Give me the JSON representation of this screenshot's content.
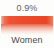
{
  "chart_data": {
    "type": "bar",
    "orientation": "horizontal",
    "title": "",
    "subtitle": "",
    "xlabel": "",
    "ylabel": "",
    "categories": [
      "Women"
    ],
    "values": [
      0.9
    ],
    "value_labels": [
      "0.9%"
    ],
    "unit": "%",
    "series": [
      {
        "name": "Women",
        "values": [
          0.9
        ],
        "color": "#ea4a2b"
      }
    ],
    "xlim": [
      0,
      0.9
    ],
    "grid": false,
    "legend": "none",
    "annotations": []
  },
  "widget": {
    "value_text": "0.9%",
    "category_text": "Women",
    "bar_fill_percent": 100,
    "colors": {
      "background": "#fdfdfc",
      "bar_start": "#f6b9a6",
      "bar_main": "#ea4a2b",
      "bar_end": "#ee7d5f",
      "value_text": "#5e5e5e",
      "category_text": "#4a4a4a"
    }
  }
}
